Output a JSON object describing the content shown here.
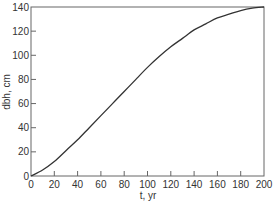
{
  "chart_data": {
    "type": "line",
    "title": "",
    "xlabel": "t, yr",
    "ylabel": "dbh, cm",
    "xlim": [
      0,
      200
    ],
    "ylim": [
      0,
      140
    ],
    "grid": false,
    "legend": null,
    "x_ticks": [
      0,
      20,
      40,
      60,
      80,
      100,
      120,
      140,
      160,
      180,
      200
    ],
    "y_ticks": [
      0,
      20,
      40,
      60,
      80,
      100,
      120,
      140
    ],
    "series": [
      {
        "name": "dbh",
        "x": [
          0,
          10,
          20,
          30,
          40,
          50,
          60,
          70,
          80,
          90,
          100,
          110,
          120,
          130,
          140,
          150,
          160,
          170,
          180,
          190,
          200
        ],
        "values": [
          0,
          5,
          12,
          21,
          30,
          40,
          50,
          60,
          70,
          80,
          90,
          99,
          107,
          114,
          121,
          126,
          131,
          134,
          137,
          139,
          140
        ]
      }
    ],
    "colors": {
      "line": "#333333",
      "axis": "#555555"
    }
  }
}
